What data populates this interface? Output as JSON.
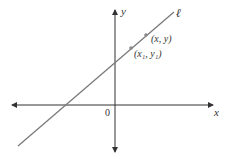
{
  "diagram": {
    "type": "coordinate-plane-line",
    "axes": {
      "x_label": "x",
      "y_label": "y",
      "origin_label": "0"
    },
    "line": {
      "label": "ℓ",
      "color": "#7a7a7a"
    },
    "points": [
      {
        "label": "(x₁, y₁)",
        "name": "point-x1-y1"
      },
      {
        "label": "(x, y)",
        "name": "point-x-y"
      }
    ],
    "colors": {
      "axis": "#333333",
      "line": "#7a7a7a",
      "point": "#8a8a8a"
    }
  }
}
